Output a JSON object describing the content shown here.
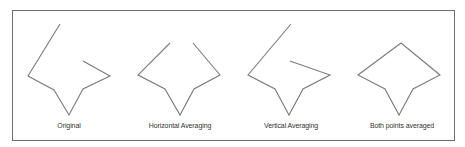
{
  "diagram": {
    "line_color": "#7a7a7a",
    "frame_color": "#6e6e6e",
    "panels": [
      {
        "id": "original",
        "label": "Original",
        "description": "Open polyline: long stroke from top to left vertex, down to bottom notch, up to right vertex, then back toward center"
      },
      {
        "id": "horizontal",
        "label": "Horizontal Averaging",
        "description": "Symmetric open polyline with both top endpoints at the same height"
      },
      {
        "id": "vertical",
        "label": "Vertical Averaging",
        "description": "Open polyline with tall left stroke and inner right end point"
      },
      {
        "id": "both",
        "label": "Both points averaged",
        "description": "Closed kite/diamond shape with a bottom notch"
      }
    ]
  }
}
